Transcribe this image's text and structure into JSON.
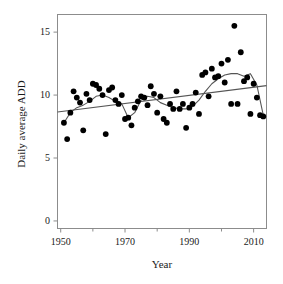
{
  "chart_data": {
    "type": "scatter",
    "title": "",
    "xlabel": "Year",
    "ylabel": "Daily average ADD",
    "xlim": [
      1949,
      2014
    ],
    "ylim": [
      -0.6,
      16.4
    ],
    "grid": false,
    "legend": null,
    "xticks": [
      1950,
      1970,
      1990,
      2010
    ],
    "xticklabels": [
      "1950",
      "1970",
      "1990",
      "2010"
    ],
    "xminorticks": [
      1960,
      1980,
      2000
    ],
    "yticks": [
      0,
      5,
      10,
      15
    ],
    "yticklabels": [
      "0",
      "5",
      "10",
      "15"
    ],
    "point_color": "#000000",
    "line_color": "#555555",
    "series": [
      {
        "name": "Daily average ADD",
        "kind": "scatter",
        "x": [
          1951,
          1952,
          1953,
          1954,
          1955,
          1956,
          1957,
          1958,
          1959,
          1960,
          1961,
          1962,
          1963,
          1964,
          1965,
          1966,
          1967,
          1968,
          1969,
          1970,
          1971,
          1972,
          1973,
          1974,
          1975,
          1976,
          1977,
          1978,
          1979,
          1980,
          1981,
          1982,
          1983,
          1984,
          1985,
          1986,
          1987,
          1988,
          1989,
          1990,
          1991,
          1992,
          1993,
          1994,
          1995,
          1996,
          1997,
          1998,
          1999,
          2000,
          2001,
          2002,
          2003,
          2004,
          2005,
          2006,
          2007,
          2008,
          2009,
          2010,
          2011,
          2012,
          2013
        ],
        "y": [
          7.8,
          6.5,
          8.6,
          10.3,
          9.8,
          9.4,
          7.2,
          10.1,
          9.6,
          10.9,
          10.8,
          10.5,
          10.0,
          6.9,
          10.4,
          10.6,
          9.6,
          9.3,
          10.0,
          8.1,
          8.2,
          7.6,
          9.0,
          9.5,
          9.9,
          9.8,
          9.2,
          10.7,
          10.1,
          8.6,
          9.9,
          8.1,
          7.8,
          9.3,
          8.9,
          10.3,
          8.9,
          9.3,
          7.4,
          9.0,
          9.3,
          10.2,
          8.5,
          11.6,
          11.8,
          9.9,
          12.1,
          11.4,
          11.5,
          12.5,
          11.0,
          12.8,
          9.3,
          15.5,
          9.3,
          13.4,
          11.1,
          11.4,
          8.5,
          10.9,
          9.8,
          8.4,
          8.3
        ]
      },
      {
        "name": "Linear trend",
        "kind": "line",
        "x": [
          1949,
          2014
        ],
        "y": [
          8.66,
          10.75
        ]
      },
      {
        "name": "Smoothed trend",
        "kind": "line",
        "x": [
          1951,
          1953,
          1955,
          1957,
          1959,
          1961,
          1963,
          1965,
          1967,
          1969,
          1971,
          1973,
          1975,
          1977,
          1979,
          1981,
          1983,
          1985,
          1987,
          1989,
          1991,
          1993,
          1995,
          1997,
          1999,
          2001,
          2003,
          2005,
          2007,
          2009,
          2011,
          2013
        ],
        "y": [
          7.8,
          8.6,
          9.0,
          9.2,
          9.5,
          9.9,
          10.0,
          9.8,
          9.5,
          9.3,
          8.2,
          8.6,
          9.6,
          9.9,
          9.8,
          9.4,
          9.2,
          9.0,
          8.9,
          8.9,
          9.1,
          9.6,
          10.3,
          10.9,
          11.3,
          11.6,
          11.7,
          11.7,
          11.5,
          11.7,
          10.8,
          8.4
        ]
      }
    ]
  },
  "axes": {
    "y_title": "Daily average ADD",
    "x_title": "Year"
  }
}
